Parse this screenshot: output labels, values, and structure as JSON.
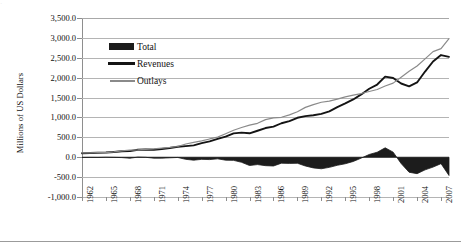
{
  "page": {
    "top_artifact_text": "·",
    "bottom_rule": "horizontal-rule"
  },
  "chart_data": {
    "type": "line",
    "title": "",
    "subtitle": "",
    "xlabel": "",
    "ylabel": "Millions of US Dollars",
    "ylim": [
      -1000,
      3500
    ],
    "xlim": [
      1962,
      2008
    ],
    "grid": true,
    "legend_position": "inside-top-left",
    "ytick_labels": [
      "3,500.0",
      "3,000.0",
      "2,500.0",
      "2,000.0",
      "1,500.0",
      "1,000.0",
      "500.0",
      "0.0",
      "-500.0",
      "-1,000.0"
    ],
    "ytick_values": [
      3500,
      3000,
      2500,
      2000,
      1500,
      1000,
      500,
      0,
      -500,
      -1000
    ],
    "xtick_labels": [
      "1962",
      "1965",
      "1968",
      "1971",
      "1974",
      "1977",
      "1980",
      "1983",
      "1986",
      "1989",
      "1992",
      "1995",
      "1998",
      "2001",
      "2004",
      "2007"
    ],
    "xtick_values": [
      1962,
      1965,
      1968,
      1971,
      1974,
      1977,
      1980,
      1983,
      1986,
      1989,
      1992,
      1995,
      1998,
      2001,
      2004,
      2007
    ],
    "x": [
      1962,
      1963,
      1964,
      1965,
      1966,
      1967,
      1968,
      1969,
      1970,
      1971,
      1972,
      1973,
      1974,
      1975,
      1976,
      1977,
      1978,
      1979,
      1980,
      1981,
      1982,
      1983,
      1984,
      1985,
      1986,
      1987,
      1988,
      1989,
      1990,
      1991,
      1992,
      1993,
      1994,
      1995,
      1996,
      1997,
      1998,
      1999,
      2000,
      2001,
      2002,
      2003,
      2004,
      2005,
      2006,
      2007,
      2008
    ],
    "series": [
      {
        "name": "Total",
        "style": "filled-area",
        "color": "#1c1c1c",
        "values": [
          -7,
          -5,
          -6,
          -1,
          -4,
          -9,
          -25,
          3,
          -3,
          -23,
          -23,
          -15,
          -6,
          -53,
          -74,
          -54,
          -59,
          -41,
          -74,
          -79,
          -128,
          -208,
          -185,
          -212,
          -221,
          -150,
          -155,
          -152,
          -221,
          -269,
          -290,
          -255,
          -203,
          -164,
          -107,
          -22,
          69,
          126,
          236,
          128,
          -158,
          -378,
          -413,
          -318,
          -248,
          -161,
          -459
        ]
      },
      {
        "name": "Revenues",
        "style": "thick-line",
        "color": "#141414",
        "values": [
          100,
          107,
          113,
          117,
          131,
          149,
          153,
          187,
          193,
          187,
          207,
          231,
          263,
          279,
          298,
          356,
          400,
          463,
          517,
          599,
          618,
          601,
          666,
          734,
          769,
          854,
          909,
          991,
          1032,
          1055,
          1091,
          1154,
          1259,
          1352,
          1453,
          1579,
          1722,
          1827,
          2025,
          1991,
          1853,
          1782,
          1880,
          2154,
          2407,
          2568,
          2524
        ]
      },
      {
        "name": "Outlays",
        "style": "thin-line",
        "color": "#8a8a8a",
        "values": [
          107,
          111,
          119,
          118,
          135,
          158,
          178,
          184,
          196,
          210,
          231,
          246,
          269,
          332,
          372,
          409,
          459,
          504,
          591,
          678,
          746,
          808,
          852,
          946,
          990,
          1004,
          1064,
          1143,
          1253,
          1324,
          1382,
          1409,
          1462,
          1516,
          1560,
          1601,
          1653,
          1702,
          1789,
          1863,
          2011,
          2160,
          2293,
          2472,
          2655,
          2729,
          2983
        ]
      }
    ]
  },
  "legend": {
    "items": [
      {
        "label": "Total",
        "key": "area-swatch"
      },
      {
        "label": "Revenues",
        "key": "thick-line-swatch"
      },
      {
        "label": "Outlays",
        "key": "thin-line-swatch"
      }
    ]
  }
}
